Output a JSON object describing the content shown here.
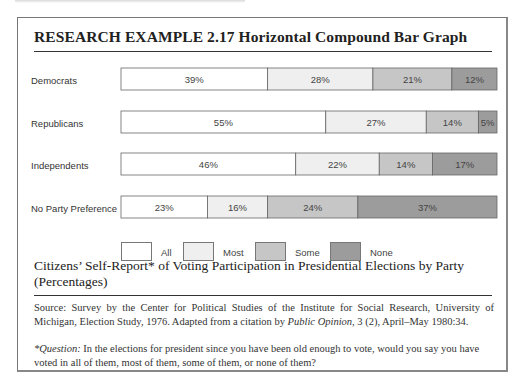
{
  "title": "RESEARCH  EXAMPLE 2.17  Horizontal Compound Bar Graph",
  "caption": "Citizens’ Self-Report* of Voting Participation in Presidential Elections by Party (Percentages)",
  "source": {
    "prefix": "Source: Survey by the Center for Political Studies of the Institute for Social Research, University of Michigan, Election Study, 1976. Adapted from a citation by ",
    "italic": "Public Opinion,",
    "suffix": " 3 (2), April–May 1980:34."
  },
  "question": {
    "label": "*Question:",
    "text": " In the elections for president since you have been old enough to vote, would you say you have voted in all of them, most of them, some of them, or none of them?"
  },
  "chart_data": {
    "type": "bar",
    "orientation": "horizontal",
    "stacked": true,
    "title": "Horizontal Compound Bar Graph",
    "xlabel": "",
    "ylabel": "",
    "unit": "%",
    "categories": [
      "Democrats",
      "Republicans",
      "Independents",
      "No Party Preference"
    ],
    "series": [
      {
        "name": "All",
        "color": "#ffffff",
        "values": [
          39,
          55,
          46,
          23
        ],
        "labels": [
          "39%",
          "55%",
          "46%",
          "23%"
        ]
      },
      {
        "name": "Most",
        "color": "#efefef",
        "values": [
          28,
          27,
          22,
          16
        ],
        "labels": [
          "28%",
          "27%",
          "22%",
          "16%"
        ]
      },
      {
        "name": "Some",
        "color": "#c6c6c6",
        "values": [
          21,
          14,
          14,
          24
        ],
        "labels": [
          "21%",
          "14%",
          "14%",
          "24%"
        ]
      },
      {
        "name": "None",
        "color": "#9c9c9c",
        "values": [
          12,
          5,
          17,
          37
        ],
        "labels": [
          "12%",
          "5%",
          "17%",
          "37%"
        ]
      }
    ],
    "legend_position": "bottom",
    "grid": false
  }
}
